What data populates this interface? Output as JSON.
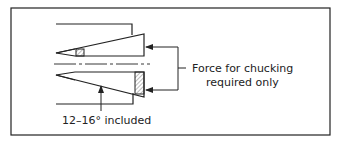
{
  "diagram": {
    "labels": {
      "force_line1": "Force for chucking",
      "force_line2": "required only",
      "angle": "12–16° included"
    },
    "colors": {
      "stroke": "#222222",
      "background": "#ffffff",
      "hatch": "#555555"
    }
  }
}
